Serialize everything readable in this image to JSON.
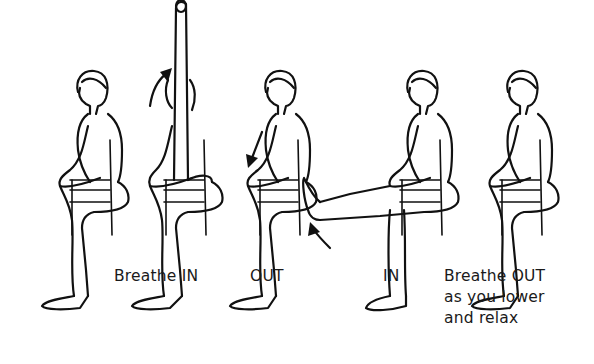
{
  "figures": [
    {
      "id": 1,
      "pose": "seated-neutral",
      "caption": ""
    },
    {
      "id": 2,
      "pose": "arm-raised",
      "caption": "Breathe IN",
      "arrow": "up-curve"
    },
    {
      "id": 3,
      "pose": "arm-lowered",
      "caption": "OUT",
      "arrow": "down"
    },
    {
      "id": 4,
      "pose": "leg-extended",
      "caption": "IN",
      "arrow": "up-curve"
    },
    {
      "id": 5,
      "pose": "seated-relaxed",
      "caption_lines": [
        "Breathe OUT",
        "as you lower",
        "and relax"
      ]
    }
  ],
  "captions": {
    "fig2": "Breathe IN",
    "fig3": "OUT",
    "fig4": "IN",
    "fig5_line1": "Breathe OUT",
    "fig5_line2": "as you lower",
    "fig5_line3": "and relax"
  },
  "colors": {
    "line": "#111111",
    "background": "#ffffff"
  }
}
